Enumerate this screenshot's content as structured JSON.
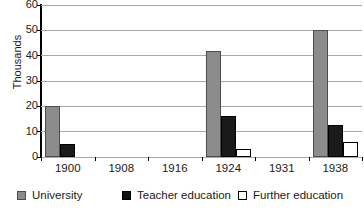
{
  "chart_data": {
    "type": "bar",
    "title": "",
    "subtitle": "",
    "xlabel": "",
    "ylabel": "Thousands",
    "categories": [
      "1900",
      "1908",
      "1916",
      "1924",
      "1931",
      "1938"
    ],
    "series": [
      {
        "name": "University",
        "color": "#8c8c8c",
        "values": [
          20,
          0,
          0,
          42,
          0,
          50
        ]
      },
      {
        "name": "Teacher education",
        "color": "#1a1a1a",
        "values": [
          5,
          0,
          0,
          16,
          0,
          12.5
        ]
      },
      {
        "name": "Further education",
        "color": "#ffffff",
        "values": [
          0,
          0,
          0,
          3,
          0,
          6
        ]
      }
    ],
    "ylim": [
      0,
      60
    ],
    "yticks": [
      0,
      10,
      20,
      30,
      40,
      50,
      60
    ],
    "ytick_labels": [
      "0",
      "10",
      "20",
      "30",
      "40",
      "50",
      "60"
    ],
    "grid": true,
    "grid_axis": "y",
    "legend_position": "bottom",
    "legend_orientation": "horizontal"
  },
  "axes": {
    "y_title": "Thousands",
    "y_tick_labels": [
      "60",
      "50",
      "40",
      "30",
      "20",
      "10",
      "0"
    ],
    "x_tick_labels": [
      "1900",
      "1908",
      "1916",
      "1924",
      "1931",
      "1938"
    ]
  },
  "legend": {
    "items": [
      {
        "label": "University",
        "swatch": "gray-filled-square",
        "color": "#8c8c8c"
      },
      {
        "label": "Teacher education",
        "swatch": "black-filled-square",
        "color": "#1a1a1a"
      },
      {
        "label": "Further education",
        "swatch": "white-outlined-square",
        "color": "#ffffff"
      }
    ]
  },
  "caption": {
    "sliver_text": ""
  }
}
